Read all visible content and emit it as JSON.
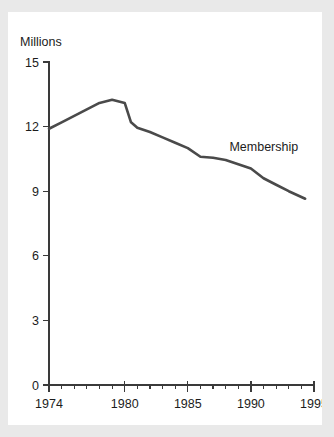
{
  "card": {
    "background": "#ffffff",
    "page_background": "#e9e9e9"
  },
  "chart_data": {
    "type": "line",
    "title": "",
    "subtitle": "",
    "xlabel": "",
    "ylabel": "Millions",
    "ylabel_position": "above-axis",
    "grid": false,
    "legend": "inline-annotation",
    "line_color": "#4a4a4a",
    "axis_color": "#3a3a3a",
    "xlim": [
      1974,
      1995
    ],
    "ylim": [
      0,
      15
    ],
    "yticks": [
      0,
      3,
      6,
      9,
      12,
      15
    ],
    "ytick_labels": [
      "0",
      "3",
      "6",
      "9",
      "12",
      "15"
    ],
    "xticks": [
      1974,
      1980,
      1985,
      1990,
      1995
    ],
    "xtick_labels": [
      "1974",
      "1980",
      "1985",
      "1990",
      "1995"
    ],
    "xticks_minor": [
      1975,
      1976,
      1977,
      1978,
      1979,
      1981,
      1982,
      1983,
      1984,
      1986,
      1987,
      1988,
      1989,
      1991,
      1992,
      1993,
      1994
    ],
    "annotations": [
      {
        "text": "Membership",
        "x": 1988.3,
        "y": 10.85
      }
    ],
    "series": [
      {
        "name": "Membership",
        "x": [
          1974,
          1975,
          1976,
          1977,
          1978,
          1979,
          1980,
          1980.5,
          1981,
          1982,
          1983,
          1984,
          1985,
          1986,
          1987,
          1988,
          1989,
          1990,
          1991,
          1992,
          1993,
          1994.3
        ],
        "values": [
          11.9,
          12.2,
          12.5,
          12.8,
          13.1,
          13.25,
          13.1,
          12.2,
          11.95,
          11.75,
          11.5,
          11.25,
          11.0,
          10.6,
          10.55,
          10.45,
          10.25,
          10.05,
          9.6,
          9.3,
          9.0,
          8.65
        ]
      }
    ]
  }
}
